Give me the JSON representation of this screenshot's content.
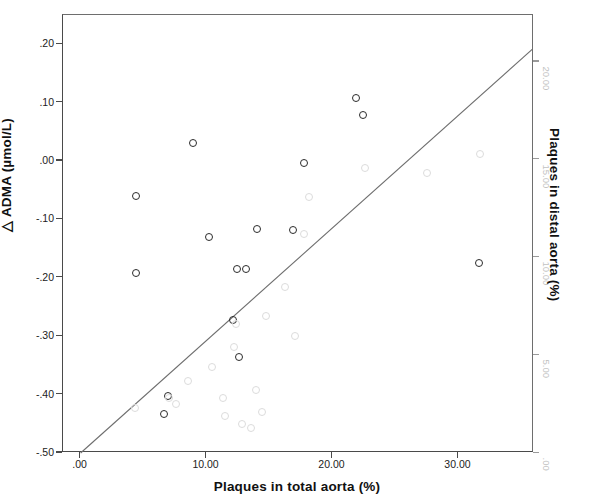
{
  "figure": {
    "background_color": "#ffffff",
    "frame_color": "#4a4a4a"
  },
  "axes": {
    "left": {
      "title": "△ ADMA (µmol/L)",
      "ticks": [
        ".20",
        ".10",
        ".00",
        "-.10",
        "-.20",
        "-.30",
        "-.40",
        "-.50"
      ],
      "tick_values": [
        0.2,
        0.1,
        0.0,
        -0.1,
        -0.2,
        -0.3,
        -0.4,
        -0.5
      ],
      "range": [
        -0.5,
        0.25
      ],
      "color": "#222222"
    },
    "bottom": {
      "title": "Plaques in total aorta (%)",
      "ticks": [
        ".00",
        "10.00",
        "20.00",
        "30.00"
      ],
      "tick_values": [
        0,
        10,
        20,
        30
      ],
      "range": [
        -1.4,
        36.0
      ],
      "color": "#222222"
    },
    "right": {
      "title": "Plaques in distal aorta (%)",
      "ticks": [
        "20.00",
        "15.00",
        "10.00",
        "5.00",
        ".00"
      ],
      "tick_values": [
        20,
        15,
        10,
        5,
        0
      ],
      "range": [
        0,
        22.4
      ],
      "color": "#c2c2c2"
    }
  },
  "chart_data": {
    "type": "scatter",
    "title": "",
    "xlabel": "Plaques in total aorta (%)",
    "ylabel": "△ ADMA (µmol/L)",
    "y2label": "Plaques in distal aorta (%)",
    "xlim": [
      -1.4,
      36.0
    ],
    "ylim": [
      -0.5,
      0.25
    ],
    "y2lim": [
      0,
      22.4
    ],
    "grid": false,
    "legend": "none",
    "series": [
      {
        "name": "△ ADMA (µmol/L)",
        "axis": "left",
        "marker": "open-circle",
        "color": "#2b2b2b",
        "points": [
          {
            "x": 4.4,
            "y": -0.06
          },
          {
            "x": 4.4,
            "y": -0.191
          },
          {
            "x": 8.9,
            "y": 0.03
          },
          {
            "x": 6.9,
            "y": -0.402
          },
          {
            "x": 6.6,
            "y": -0.433
          },
          {
            "x": 10.2,
            "y": -0.13
          },
          {
            "x": 12.1,
            "y": -0.272
          },
          {
            "x": 12.4,
            "y": -0.185
          },
          {
            "x": 13.1,
            "y": -0.185
          },
          {
            "x": 12.6,
            "y": -0.335
          },
          {
            "x": 14.0,
            "y": -0.116
          },
          {
            "x": 16.9,
            "y": -0.118
          },
          {
            "x": 17.7,
            "y": -0.003
          },
          {
            "x": 21.9,
            "y": 0.108
          },
          {
            "x": 22.4,
            "y": 0.079
          },
          {
            "x": 31.6,
            "y": -0.174
          }
        ]
      },
      {
        "name": "Plaques in distal aorta (%)",
        "axis": "right",
        "marker": "open-circle",
        "color": "#dcdcdc",
        "points": [
          {
            "x": 4.3,
            "y": 2.3
          },
          {
            "x": 7.0,
            "y": 2.8
          },
          {
            "x": 7.6,
            "y": 2.5
          },
          {
            "x": 8.5,
            "y": 3.7
          },
          {
            "x": 10.4,
            "y": 4.4
          },
          {
            "x": 11.3,
            "y": 2.8
          },
          {
            "x": 11.5,
            "y": 1.9
          },
          {
            "x": 12.2,
            "y": 5.4
          },
          {
            "x": 12.3,
            "y": 6.6
          },
          {
            "x": 12.8,
            "y": 1.5
          },
          {
            "x": 13.5,
            "y": 1.3
          },
          {
            "x": 13.9,
            "y": 3.2
          },
          {
            "x": 14.4,
            "y": 2.1
          },
          {
            "x": 14.7,
            "y": 7.0
          },
          {
            "x": 16.2,
            "y": 8.5
          },
          {
            "x": 17.0,
            "y": 6.0
          },
          {
            "x": 17.7,
            "y": 11.2
          },
          {
            "x": 18.1,
            "y": 13.1
          },
          {
            "x": 22.6,
            "y": 14.6
          },
          {
            "x": 27.5,
            "y": 14.3
          },
          {
            "x": 31.7,
            "y": 15.3
          }
        ]
      }
    ],
    "fit_line": {
      "name": "regression-line",
      "color": "#6e6e6e",
      "from": {
        "x": 0.0,
        "y": -0.5
      },
      "to": {
        "x": 35.9,
        "y": 0.192
      }
    }
  }
}
